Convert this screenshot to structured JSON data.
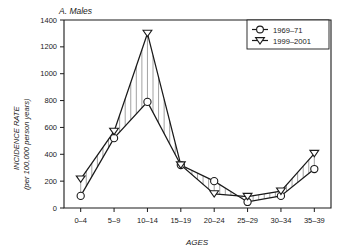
{
  "chart_data": {
    "type": "line",
    "title": "A. Males",
    "xlabel": "AGES",
    "ylabel": "INCIDENCE RATE",
    "ylabel_sub": "(per 100,000 person years)",
    "categories": [
      "0–4",
      "5–9",
      "10–14",
      "15–19",
      "20–24",
      "25–29",
      "30–34",
      "35–39"
    ],
    "ylim": [
      0,
      1400
    ],
    "yticks": [
      0,
      200,
      400,
      600,
      800,
      1000,
      1200,
      1400
    ],
    "ytick_labels": [
      "0",
      "200",
      "400",
      "600",
      "800",
      "1000",
      "1200",
      "1400"
    ],
    "grid": false,
    "legend_position": "top-right",
    "series": [
      {
        "name": "1969–71",
        "marker": "circle",
        "values": [
          90,
          520,
          790,
          320,
          200,
          45,
          90,
          290
        ]
      },
      {
        "name": "1999–2001",
        "marker": "triangle-down",
        "values": [
          215,
          570,
          1300,
          320,
          105,
          85,
          125,
          405
        ]
      }
    ],
    "colors": {
      "line": "#1a1a1a",
      "marker_fill": "#ffffff",
      "hatch": "#555555",
      "background": "#ffffff"
    }
  }
}
